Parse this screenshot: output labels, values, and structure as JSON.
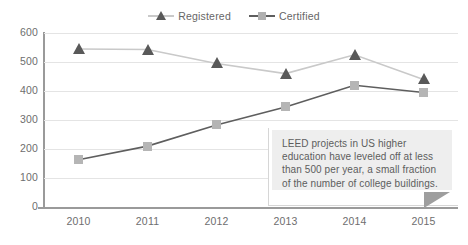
{
  "chart_data": {
    "type": "line",
    "title": "",
    "xlabel": "",
    "ylabel": "",
    "categories": [
      "2010",
      "2011",
      "2012",
      "2013",
      "2014",
      "2015"
    ],
    "ylim": [
      0,
      600
    ],
    "ytick_values": [
      600,
      500,
      400,
      300,
      200,
      100,
      0
    ],
    "ytick_labels": [
      "600",
      "500",
      "400",
      "300",
      "200",
      "100",
      "0"
    ],
    "grid": true,
    "legend_position": "top-center",
    "series": [
      {
        "name": "Registered",
        "marker": "triangle",
        "marker_color": "#595959",
        "line_color": "#c9c9c9",
        "values": [
          545,
          543,
          495,
          460,
          525,
          440
        ]
      },
      {
        "name": "Certified",
        "marker": "square",
        "marker_color": "#b5b5b5",
        "line_color": "#5e5e5e",
        "values": [
          163,
          210,
          283,
          345,
          420,
          395
        ]
      }
    ],
    "annotations": [
      {
        "text": "LEED projects in US higher education have leveled off at less than 500 per year, a small fraction of the number of college buildings.",
        "background_color": "#eeeeee",
        "text_color": "#5d5d5d",
        "pointer": "triangle-bottom-right"
      }
    ]
  },
  "legend": {
    "items": [
      {
        "label": "Registered",
        "icon": "triangle-marker-icon"
      },
      {
        "label": "Certified",
        "icon": "square-marker-icon"
      }
    ]
  },
  "callout": {
    "text": "LEED projects in US higher education have leveled off at less than 500 per year, a small fraction of the number of college buildings."
  },
  "colors": {
    "grid": "#e4e4e4",
    "axis": "#9a9a9a",
    "tick_text": "#6e6e6e",
    "registered_marker": "#595959",
    "registered_line": "#c9c9c9",
    "certified_marker": "#b5b5b5",
    "certified_line": "#5e5e5e",
    "callout_bg": "#eeeeee"
  }
}
